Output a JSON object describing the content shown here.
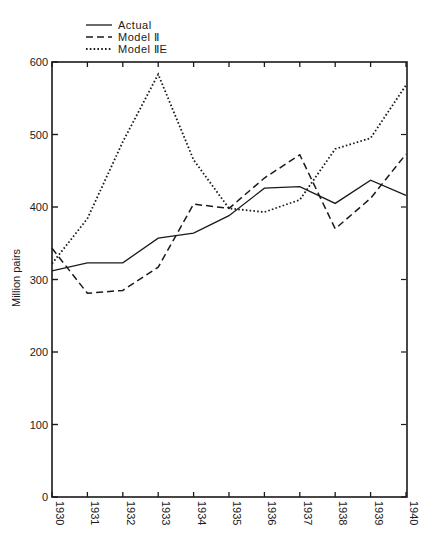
{
  "chart_data": {
    "type": "line",
    "title": "",
    "xlabel": "",
    "ylabel": "Million pairs",
    "ylim": [
      0,
      600
    ],
    "yticks": [
      0,
      100,
      200,
      300,
      400,
      500,
      600
    ],
    "x": [
      1930,
      1931,
      1932,
      1933,
      1934,
      1935,
      1936,
      1937,
      1938,
      1939,
      1940
    ],
    "grid": false,
    "legend_position": "top-left, above plot",
    "series": [
      {
        "name": "Actual",
        "style": "solid",
        "values": [
          312,
          323,
          323,
          357,
          364,
          388,
          426,
          428,
          405,
          437,
          416
        ]
      },
      {
        "name": "Model II",
        "style": "dashed",
        "values": [
          343,
          281,
          285,
          317,
          404,
          398,
          440,
          472,
          370,
          412,
          473
        ]
      },
      {
        "name": "Model IIE",
        "style": "dotted",
        "values": [
          322,
          384,
          490,
          583,
          465,
          398,
          393,
          410,
          480,
          495,
          568
        ]
      }
    ]
  },
  "legend": {
    "items": [
      {
        "label": "Actual",
        "style": "solid"
      },
      {
        "label": "Model Ⅱ",
        "style": "dashed"
      },
      {
        "label": "Model ⅡE",
        "style": "dotted"
      }
    ]
  },
  "axes": {
    "ylabel": "Million pairs",
    "yticks": [
      "0",
      "100",
      "200",
      "300",
      "400",
      "500",
      "600"
    ],
    "xticks": [
      "1930",
      "1931",
      "1932",
      "1933",
      "1934",
      "1935",
      "1936",
      "1937",
      "1938",
      "1939",
      "1940"
    ]
  },
  "colors": {
    "ink": "#1a1a1a",
    "background": "#ffffff"
  }
}
